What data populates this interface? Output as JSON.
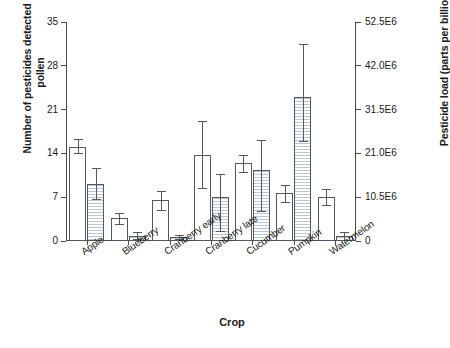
{
  "chart_data": {
    "type": "bar",
    "title": "",
    "xlabel": "Crop",
    "ylabel": "Number of pesticides detected in pollen",
    "ylabel_right": "Pesticide load (parts per billion)",
    "categories": [
      "Apple",
      "Blueberry",
      "Cranberry early",
      "Cranberry late",
      "Cucumber",
      "Pumpkin",
      "Watermelon"
    ],
    "ylim": [
      0,
      35
    ],
    "yticks": [
      0,
      7,
      14,
      21,
      28,
      35
    ],
    "ytick_labels": [
      "0",
      "7",
      "14",
      "21",
      "28",
      "35"
    ],
    "ylim_right": [
      0,
      52500000
    ],
    "yticks_right": [
      0,
      10500000,
      21000000,
      31500000,
      42000000,
      52500000
    ],
    "ytick_labels_right": [
      "0",
      "10.5E6",
      "21.0E6",
      "31.5E6",
      "42.0E6",
      "52.5E6"
    ],
    "grid": false,
    "legend": "none",
    "series": [
      {
        "name": "Number of pesticides detected in pollen",
        "axis": "left",
        "style": "open",
        "values": [
          15.1,
          3.6,
          6.5,
          13.7,
          12.4,
          7.6,
          7.0
        ],
        "err_low": [
          1.1,
          0.9,
          1.5,
          5.3,
          1.4,
          1.4,
          1.3
        ],
        "err_high": [
          1.2,
          0.9,
          1.5,
          5.4,
          1.4,
          1.4,
          1.3
        ]
      },
      {
        "name": "Pesticide load (parts per billion)",
        "axis": "right",
        "style": "hatched",
        "values": [
          13650000,
          1200000,
          900000,
          10650000,
          16950000,
          34500000,
          1200000
        ],
        "err_low": [
          3600000,
          750000,
          450000,
          8250000,
          9750000,
          10500000,
          900000
        ],
        "err_high": [
          3900000,
          900000,
          450000,
          5400000,
          7200000,
          12750000,
          900000
        ]
      }
    ]
  },
  "axes": {
    "xlabel": "Crop",
    "ylabel_left": "Number of pesticides detected in pollen",
    "ylabel_right": "Pesticide load (parts per billion)"
  }
}
